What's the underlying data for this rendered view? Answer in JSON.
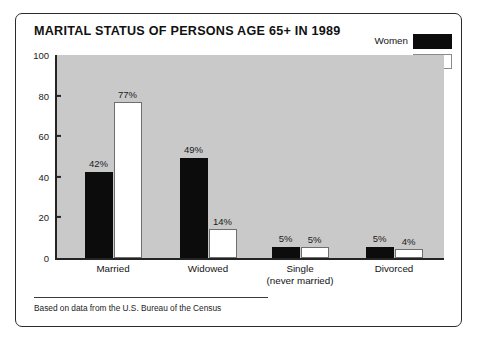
{
  "chart_data": {
    "type": "bar",
    "title": "MARITAL STATUS OF PERSONS AGE 65+ IN 1989",
    "xlabel": "",
    "ylabel": "",
    "ylim": [
      0,
      100
    ],
    "yticks": [
      0,
      20,
      40,
      60,
      80,
      100
    ],
    "ytick_labels": [
      "0",
      "20",
      "40",
      "60",
      "80",
      "100"
    ],
    "grid": false,
    "legend_position": "top-right",
    "categories": [
      "Married",
      "Widowed",
      "Single (never married)",
      "Divorced"
    ],
    "category_lines": [
      [
        "Married"
      ],
      [
        "Widowed"
      ],
      [
        "Single",
        "(never married)"
      ],
      [
        "Divorced"
      ]
    ],
    "series": [
      {
        "name": "Women",
        "color": "#0c0c0c",
        "values": [
          42,
          49,
          5,
          5
        ],
        "value_labels": [
          "42%",
          "49%",
          "5%",
          "5%"
        ]
      },
      {
        "name": "Men",
        "color": "#ffffff",
        "values": [
          77,
          14,
          5,
          4
        ],
        "value_labels": [
          "77%",
          "14%",
          "5%",
          "4%"
        ]
      }
    ],
    "note": "Based on data from the U.S. Bureau of the Census",
    "plot_background": "#c9c9c9",
    "axis_color": "#242424"
  },
  "legend": {
    "items": [
      {
        "label": "Women",
        "swatch": "black"
      },
      {
        "label": "Men",
        "swatch": "white"
      }
    ]
  },
  "footnote": {
    "text": "Based on data from the U.S. Bureau of the Census"
  }
}
